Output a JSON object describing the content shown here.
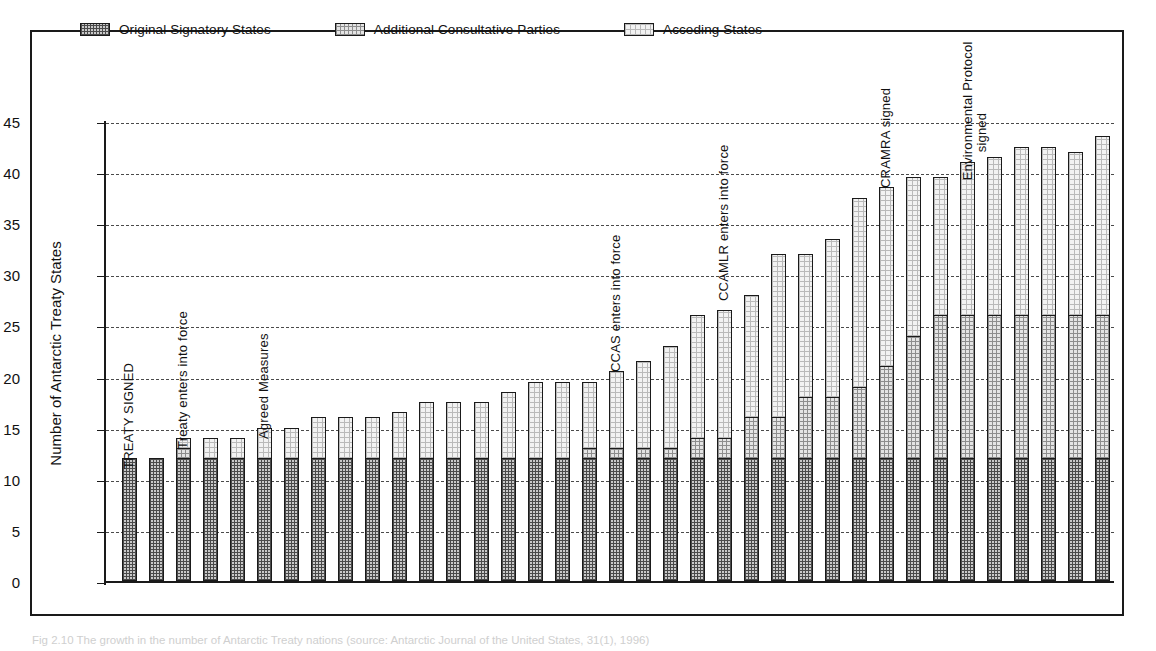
{
  "figure": {
    "caption": "Fig 2.10 The growth in the number of Antarctic Treaty nations (source: Antarctic Journal of the United States, 31(1), 1996)"
  },
  "legend": {
    "position": "top",
    "items": [
      {
        "label": "Original Signatory States",
        "swatch": "dark-crosshatch-swatch",
        "color": "#c9c9c9"
      },
      {
        "label": "Additional Consultative Parties",
        "swatch": "medium-dotted-swatch",
        "color": "#e4e4e4"
      },
      {
        "label": "Acceding States",
        "swatch": "light-dotted-swatch",
        "color": "#f2f2f2"
      }
    ]
  },
  "chart_data": {
    "type": "bar",
    "stacked": true,
    "title": "",
    "xlabel": "",
    "ylabel": "Number of Antarctic Treaty States",
    "ylim": [
      0,
      45
    ],
    "yticks": [
      0,
      5,
      10,
      15,
      20,
      25,
      30,
      35,
      40,
      45
    ],
    "grid": true,
    "x": [
      1960,
      1961,
      1962,
      1963,
      1964,
      1965,
      1966,
      1967,
      1968,
      1969,
      1970,
      1971,
      1972,
      1973,
      1974,
      1975,
      1976,
      1977,
      1978,
      1979,
      1980,
      1981,
      1982,
      1983,
      1984,
      1985,
      1986,
      1987,
      1988,
      1989,
      1990,
      1991,
      1992,
      1993,
      1994,
      1995,
      1996
    ],
    "xtick_labels": [
      "1960",
      "",
      "62",
      "",
      "64",
      "",
      "66",
      "",
      "68",
      "",
      "70",
      "",
      "72",
      "",
      "74",
      "",
      "76",
      "",
      "78",
      "",
      "80",
      "",
      "82",
      "",
      "84",
      "",
      "86",
      "",
      "88",
      "",
      "90",
      "",
      "92",
      "",
      "94",
      "",
      "96"
    ],
    "categories": [
      "1960",
      "1961",
      "1962",
      "1963",
      "1964",
      "1965",
      "1966",
      "1967",
      "1968",
      "1969",
      "1970",
      "1971",
      "1972",
      "1973",
      "1974",
      "1975",
      "1976",
      "1977",
      "1978",
      "1979",
      "1980",
      "1981",
      "1982",
      "1983",
      "1984",
      "1985",
      "1986",
      "1987",
      "1988",
      "1989",
      "1990",
      "1991",
      "1992",
      "1993",
      "1994",
      "1995",
      "1996"
    ],
    "series": [
      {
        "name": "Original Signatory States",
        "fill": "fill-original",
        "values": [
          12,
          12,
          12,
          12,
          12,
          12,
          12,
          12,
          12,
          12,
          12,
          12,
          12,
          12,
          12,
          12,
          12,
          12,
          12,
          12,
          12,
          12,
          12,
          12,
          12,
          12,
          12,
          12,
          12,
          12,
          12,
          12,
          12,
          12,
          12,
          12,
          12
        ]
      },
      {
        "name": "Additional Consultative Parties",
        "fill": "fill-consultative",
        "values": [
          0,
          0,
          1,
          0,
          0,
          0,
          0,
          0,
          0,
          0,
          0,
          0,
          0,
          0,
          0,
          0,
          0,
          1,
          1,
          1,
          1,
          2,
          2,
          4,
          4,
          6,
          6,
          7,
          9,
          12,
          14,
          14,
          14,
          14,
          14,
          14,
          14
        ]
      },
      {
        "name": "Acceding States",
        "fill": "fill-acceding",
        "values": [
          0,
          0,
          1,
          2,
          2,
          3,
          3,
          4,
          4,
          4,
          4.5,
          5.5,
          5.5,
          5.5,
          6.5,
          7.5,
          7.5,
          6.5,
          7.5,
          8.5,
          10,
          12,
          12.5,
          12,
          16,
          14,
          15.5,
          18.5,
          17.5,
          15.5,
          13.5,
          15,
          15.5,
          16.5,
          16.5,
          16,
          17.5
        ]
      }
    ],
    "totals": [
      12,
      12,
      14,
      14,
      15,
      15,
      16,
      16,
      16,
      16.5,
      17.5,
      17.5,
      17.5,
      18.5,
      19.5,
      19.5,
      19.5,
      20.5,
      21.5,
      22.5,
      25.5,
      26.5,
      28.5,
      32,
      32,
      33.5,
      37.5,
      38.5,
      39.5,
      39.5,
      40.5,
      41.5,
      42.5,
      42.5,
      42.5,
      42.5,
      43.5
    ]
  },
  "annotations": [
    {
      "text": "TREATY SIGNED",
      "year": 1960,
      "uppercase": true
    },
    {
      "text": "Treaty enters into force",
      "year": 1962,
      "uppercase": false
    },
    {
      "text": "Agreed Measures",
      "year": 1965,
      "uppercase": false
    },
    {
      "text": "CCAS enters into force",
      "year": 1978,
      "uppercase": false
    },
    {
      "text": "CCAMLR enters into force",
      "year": 1982,
      "uppercase": false
    },
    {
      "text": "CRAMRA signed",
      "year": 1988,
      "uppercase": false
    },
    {
      "text": "Environmental Protocol",
      "year": 1991,
      "uppercase": false,
      "line2": "signed"
    }
  ]
}
